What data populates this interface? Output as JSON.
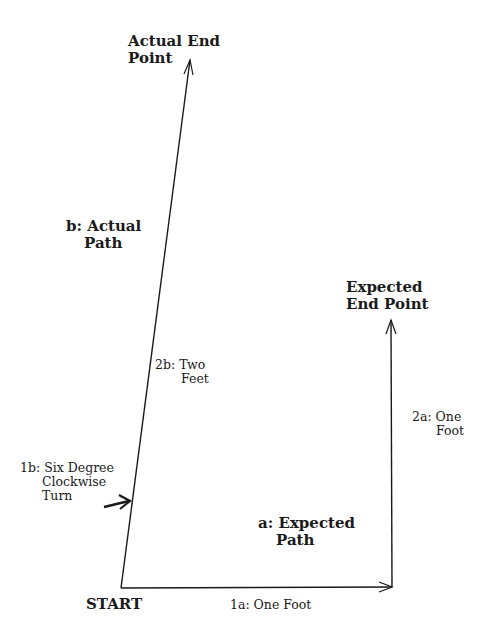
{
  "diagram": {
    "colors": {
      "line": "#1a1a1a",
      "background": "#ffffff"
    },
    "points": {
      "start": {
        "label": "START",
        "x": 121,
        "y": 588
      },
      "corner": {
        "x": 392,
        "y": 588
      },
      "expected_end": {
        "label_line1": "Expected",
        "label_line2": "End Point",
        "x": 392,
        "y": 320
      },
      "actual_end": {
        "label_line1": "Actual End",
        "label_line2": "Point",
        "x": 190,
        "y": 60
      }
    },
    "paths": {
      "expected": {
        "label_line1": "a: Expected",
        "label_line2": "Path"
      },
      "actual": {
        "label_line1": "b: Actual",
        "label_line2": "Path"
      }
    },
    "segments": {
      "s1a": {
        "label": "1a: One Foot"
      },
      "s2a": {
        "label_line1": "2a: One",
        "label_line2": "Foot"
      },
      "s1b": {
        "label_line1": "1b: Six Degree",
        "label_line2": "Clockwise",
        "label_line3": "Turn"
      },
      "s2b": {
        "label_line1": "2b: Two",
        "label_line2": "Feet"
      }
    }
  }
}
